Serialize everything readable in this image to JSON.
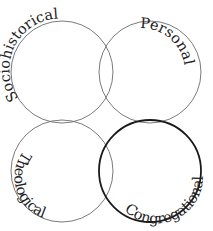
{
  "diagram": {
    "type": "venn-four-circle",
    "stroke_color": "#6b6b6b",
    "emphasis_stroke_color": "#1a1a1a",
    "circles": [
      {
        "id": "sociohistorical",
        "label": "Sociohistorical",
        "cx": 62,
        "cy": 72,
        "r": 51,
        "emphasized": false
      },
      {
        "id": "personal",
        "label": "Personal",
        "cx": 150,
        "cy": 72,
        "r": 51,
        "emphasized": false
      },
      {
        "id": "theological",
        "label": "Theological",
        "cx": 62,
        "cy": 171,
        "r": 51,
        "emphasized": false
      },
      {
        "id": "congregational",
        "label": "Congregational",
        "cx": 150,
        "cy": 171,
        "r": 51,
        "emphasized": true
      }
    ]
  }
}
